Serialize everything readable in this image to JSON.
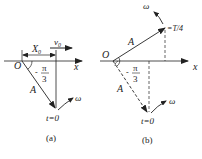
{
  "panels": [
    {
      "id": "a",
      "caption": "(a)",
      "origin_label": "O",
      "axis_label": "x",
      "displacement_label": "X",
      "displacement_sub": "0",
      "velocity_label": "v",
      "velocity_sub": "0",
      "amplitude_label": "A",
      "angle_sign": "-",
      "angle_num": "π",
      "angle_den": "3",
      "omega_label": "ω",
      "time_label": "t=0"
    },
    {
      "id": "b",
      "caption": "(b)",
      "origin_label": "O",
      "axis_label": "x",
      "amplitude_label_top": "A",
      "amplitude_label_bottom": "A",
      "angle_sign": "-",
      "angle_num": "π",
      "angle_den": "3",
      "omega_top_label": "ω",
      "omega_bottom_label": "ω",
      "time_top_label": "=T/4",
      "time_label": "t=0"
    }
  ],
  "colors": {
    "ink": "#222222",
    "background": "#ffffff"
  }
}
